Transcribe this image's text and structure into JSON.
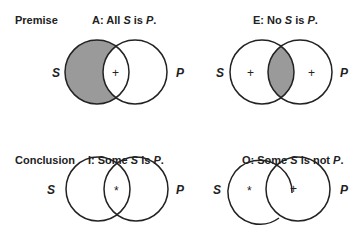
{
  "rows": [
    {
      "label": "Premise"
    },
    {
      "label": "Conclusion"
    }
  ],
  "diagrams": {
    "A": {
      "prefix": "A:  All ",
      "s": "S",
      "mid": " is ",
      "p": "P",
      "end": ".",
      "left_label": "S",
      "right_label": "P",
      "shaded": "S-only",
      "mark": "+"
    },
    "E": {
      "prefix": "E:  No ",
      "s": "S",
      "mid": " is ",
      "p": "P",
      "end": ".",
      "left_label": "S",
      "right_label": "P",
      "shaded": "intersection",
      "mark_left": "+",
      "mark_right": "+"
    },
    "I": {
      "prefix": "I:  Some ",
      "s": "S",
      "mid": " is ",
      "p": "P",
      "end": ".",
      "left_label": "S",
      "right_label": "P",
      "mark": "*"
    },
    "O": {
      "prefix": "O:  Some ",
      "s": "S",
      "mid": " is not ",
      "p": "P",
      "end": ".",
      "left_label": "S",
      "right_label": "P",
      "mark_left": "*",
      "mark_right": "+"
    }
  },
  "colors": {
    "shade": "#9a9a9a",
    "stroke": "#222222"
  }
}
